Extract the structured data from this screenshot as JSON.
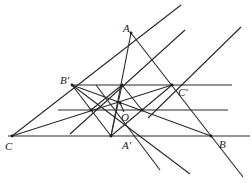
{
  "diagram": {
    "title": "",
    "labels": {
      "A": "A",
      "B": "B",
      "C": "C",
      "A_prime": "A′",
      "B_prime": "B′",
      "C_prime": "C′",
      "O": "O"
    },
    "points": {
      "A": [
        131,
        33
      ],
      "B": [
        211,
        136
      ],
      "C": [
        12,
        136
      ],
      "A_prime": [
        111,
        136
      ],
      "B_prime": [
        72,
        85
      ],
      "C_prime": [
        172,
        85
      ],
      "O": [
        120,
        103
      ],
      "M_top": [
        122,
        85
      ],
      "P_left": [
        91,
        110
      ],
      "P_right": [
        142,
        110
      ]
    },
    "colors": {
      "line": "#2a2a2a",
      "text": "#222222",
      "background": "#ffffff"
    }
  }
}
